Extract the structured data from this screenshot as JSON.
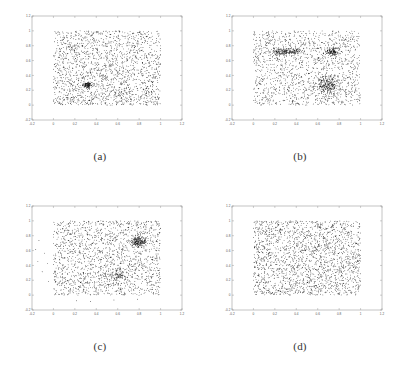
{
  "figure": {
    "background_color": "#ffffff",
    "point_color": "#1a1a1a",
    "axis_color": "#888888",
    "tick_label_color": "#555555"
  },
  "panels": [
    {
      "id": "a",
      "caption": "(a)",
      "chart_data": {
        "type": "scatter",
        "title": "",
        "xlabel": "",
        "ylabel": "",
        "xlim": [
          -0.2,
          1.2
        ],
        "ylim": [
          -0.2,
          1.2
        ],
        "xticks": [
          "-0.2",
          "0",
          "0.2",
          "0.4",
          "0.6",
          "0.8",
          "1",
          "1.2"
        ],
        "yticks": [
          "-0.2",
          "0",
          "0.2",
          "0.4",
          "0.6",
          "0.8",
          "1",
          "1.2"
        ],
        "grid": false,
        "legend": "none",
        "n_points": 2000,
        "description": "Uniform random points over the unit square with one dense circular cluster",
        "background_points": 1850,
        "background_region": [
          0.0,
          1.0,
          0.0,
          1.0
        ],
        "clusters": [
          {
            "cx": 0.32,
            "cy": 0.27,
            "sx": 0.022,
            "sy": 0.018,
            "n": 150
          }
        ],
        "outliers": []
      }
    },
    {
      "id": "b",
      "caption": "(b)",
      "chart_data": {
        "type": "scatter",
        "title": "",
        "xlabel": "",
        "ylabel": "",
        "xlim": [
          -0.2,
          1.2
        ],
        "ylim": [
          -0.2,
          1.2
        ],
        "xticks": [
          "-0.2",
          "0",
          "0.2",
          "0.4",
          "0.6",
          "0.8",
          "1",
          "1.2"
        ],
        "yticks": [
          "-0.2",
          "0",
          "0.2",
          "0.4",
          "0.6",
          "0.8",
          "1",
          "1.2"
        ],
        "grid": false,
        "legend": "none",
        "n_points": 2000,
        "description": "Uniform random points over the unit square with three dense clusters",
        "background_points": 1450,
        "background_region": [
          0.0,
          1.0,
          0.0,
          1.0
        ],
        "clusters": [
          {
            "cx": 0.3,
            "cy": 0.72,
            "sx": 0.075,
            "sy": 0.022,
            "n": 230
          },
          {
            "cx": 0.735,
            "cy": 0.725,
            "sx": 0.035,
            "sy": 0.03,
            "n": 150
          },
          {
            "cx": 0.695,
            "cy": 0.275,
            "sx": 0.06,
            "sy": 0.055,
            "n": 260
          }
        ],
        "outliers": []
      }
    },
    {
      "id": "c",
      "caption": "(c)",
      "chart_data": {
        "type": "scatter",
        "title": "",
        "xlabel": "",
        "ylabel": "",
        "xlim": [
          -0.2,
          1.2
        ],
        "ylim": [
          -0.2,
          1.2
        ],
        "xticks": [
          "-0.2",
          "0",
          "0.2",
          "0.4",
          "0.6",
          "0.8",
          "1",
          "1.2"
        ],
        "yticks": [
          "-0.2",
          "0",
          "0.2",
          "0.4",
          "0.6",
          "0.8",
          "1",
          "1.2"
        ],
        "grid": false,
        "legend": "none",
        "n_points": 2000,
        "description": "Uniform random points with a dense upper-right cluster, a moderate lower-right cluster, and a few sparse outliers left of and below the unit square",
        "background_points": 1650,
        "background_region": [
          0.0,
          1.0,
          0.0,
          1.0
        ],
        "clusters": [
          {
            "cx": 0.8,
            "cy": 0.715,
            "sx": 0.042,
            "sy": 0.035,
            "n": 200
          },
          {
            "cx": 0.615,
            "cy": 0.255,
            "sx": 0.055,
            "sy": 0.06,
            "n": 130
          }
        ],
        "outliers": [
          {
            "x": -0.135,
            "y": 0.735
          },
          {
            "x": -0.165,
            "y": 0.615
          },
          {
            "x": -0.085,
            "y": 0.565
          },
          {
            "x": -0.145,
            "y": 0.455
          },
          {
            "x": -0.055,
            "y": 0.425
          },
          {
            "x": -0.105,
            "y": 0.315
          },
          {
            "x": -0.045,
            "y": 0.185
          },
          {
            "x": 0.215,
            "y": -0.075
          },
          {
            "x": 0.345,
            "y": -0.085
          },
          {
            "x": 0.565,
            "y": -0.065
          },
          {
            "x": 0.785,
            "y": -0.055
          }
        ]
      }
    },
    {
      "id": "d",
      "caption": "(d)",
      "chart_data": {
        "type": "scatter",
        "title": "",
        "xlabel": "",
        "ylabel": "",
        "xlim": [
          -0.2,
          1.2
        ],
        "ylim": [
          -0.2,
          1.2
        ],
        "xticks": [
          "-0.2",
          "0",
          "0.2",
          "0.4",
          "0.6",
          "0.8",
          "1",
          "1.2"
        ],
        "yticks": [
          "-0.2",
          "0",
          "0.2",
          "0.4",
          "0.6",
          "0.8",
          "1",
          "1.2"
        ],
        "grid": false,
        "legend": "none",
        "n_points": 2000,
        "description": "Uniform random points over the unit square with no distinct clusters",
        "background_points": 2000,
        "background_region": [
          0.0,
          1.0,
          0.0,
          1.0
        ],
        "clusters": [],
        "outliers": []
      }
    }
  ]
}
